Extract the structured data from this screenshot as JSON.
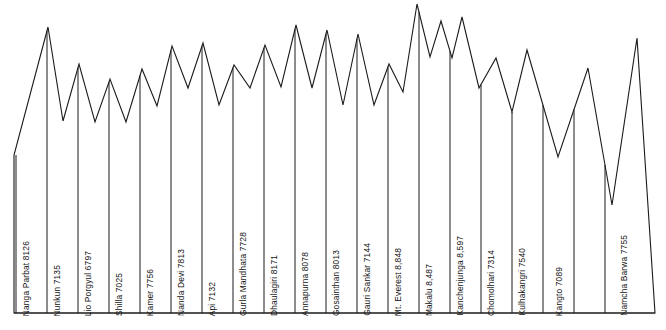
{
  "figure": {
    "type": "mountain-profile-silhouette",
    "line_color": "#1a1a1a",
    "fill_color": "#ffffff",
    "background": "#ffffff",
    "baseline_label": "baseline-axis"
  },
  "chart_data": {
    "type": "line",
    "title": "",
    "subtitle": "",
    "xlabel": "",
    "ylabel": "",
    "grid": false,
    "legend": null,
    "value_unit": "metres",
    "note": "Silhouette profile of Himalayan peaks from west (left) to east (right); each labelled column is one summit, peak apex height is proportional to elevation.",
    "categories": [
      "Nanga Parbat 8126",
      "Nunkun 7135",
      "Lio Porgyul 6797",
      "Shilla 7025",
      "Kamer 7756",
      "Nanda Devi 7813",
      "Api 7132",
      "Gurla Mandhata 7728",
      "Dhaulagiri 8171",
      "Annapurna 8078",
      "Gosainthan 8013",
      "Gauri Sankar 7144",
      "Mt. Everest 8,848",
      "Makalu 8,487",
      "Kanchenjunga 8,597",
      "Chomolhari 7314",
      "Kulhakangri 7540",
      "Kangto 7089",
      "Namcha Barwa 7755"
    ],
    "names": [
      "Nanga Parbat",
      "Nunkun",
      "Lio Porgyul",
      "Shilla",
      "Kamer",
      "Nanda Devi",
      "Api",
      "Gurla Mandhata",
      "Dhaulagiri",
      "Annapurna",
      "Gosainthan",
      "Gauri Sankar",
      "Mt. Everest",
      "Makalu",
      "Kanchenjunga",
      "Chomolhari",
      "Kulhakangri",
      "Kangto",
      "Namcha Barwa"
    ],
    "values": [
      8126,
      7135,
      6797,
      7025,
      7756,
      7813,
      7132,
      7728,
      8171,
      8078,
      8013,
      7144,
      8848,
      8487,
      8597,
      7314,
      7540,
      7089,
      7755
    ],
    "elevation_labels": [
      "8126",
      "7135",
      "6797",
      "7025",
      "7756",
      "7813",
      "7132",
      "7728",
      "8171",
      "8078",
      "8013",
      "7144",
      "8,848",
      "8,487",
      "8,597",
      "7314",
      "7540",
      "7089",
      "7755"
    ],
    "ylim": [
      0,
      8848
    ]
  },
  "geometry": {
    "note": "pixel coordinates used to draw the silhouette outline",
    "baseline_y": 313,
    "left_foot_x": 14,
    "right_foot_x": 655,
    "peaks_px": [
      {
        "x": 48,
        "y": 27
      },
      {
        "x": 79,
        "y": 64
      },
      {
        "x": 110,
        "y": 79
      },
      {
        "x": 142,
        "y": 69
      },
      {
        "x": 172,
        "y": 46
      },
      {
        "x": 203,
        "y": 43
      },
      {
        "x": 234,
        "y": 65
      },
      {
        "x": 265,
        "y": 45
      },
      {
        "x": 296,
        "y": 25
      },
      {
        "x": 327,
        "y": 30
      },
      {
        "x": 358,
        "y": 34
      },
      {
        "x": 389,
        "y": 64
      },
      {
        "x": 417,
        "y": 4
      },
      {
        "x": 441,
        "y": 21
      },
      {
        "x": 462,
        "y": 17
      },
      {
        "x": 496,
        "y": 58
      },
      {
        "x": 527,
        "y": 50
      },
      {
        "x": 588,
        "y": 68
      },
      {
        "x": 637,
        "y": 38
      }
    ],
    "valleys_px": [
      {
        "x": 63,
        "y": 121
      },
      {
        "x": 95,
        "y": 122
      },
      {
        "x": 126,
        "y": 122
      },
      {
        "x": 157,
        "y": 106
      },
      {
        "x": 188,
        "y": 88
      },
      {
        "x": 219,
        "y": 105
      },
      {
        "x": 250,
        "y": 88
      },
      {
        "x": 281,
        "y": 87
      },
      {
        "x": 312,
        "y": 88
      },
      {
        "x": 343,
        "y": 105
      },
      {
        "x": 374,
        "y": 105
      },
      {
        "x": 403,
        "y": 92
      },
      {
        "x": 430,
        "y": 57
      },
      {
        "x": 452,
        "y": 58
      },
      {
        "x": 479,
        "y": 88
      },
      {
        "x": 512,
        "y": 112
      },
      {
        "x": 558,
        "y": 157
      },
      {
        "x": 612,
        "y": 205
      }
    ],
    "dividers_x": [
      16,
      47,
      78,
      109,
      140,
      171,
      202,
      233,
      264,
      295,
      326,
      357,
      388,
      419,
      450,
      481,
      512,
      543,
      574,
      605
    ],
    "label_x": [
      22,
      53,
      84,
      115,
      146,
      177,
      208,
      239,
      270,
      301,
      332,
      363,
      394,
      425,
      456,
      487,
      518,
      555,
      620
    ]
  }
}
